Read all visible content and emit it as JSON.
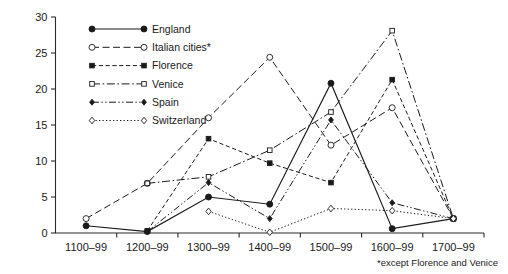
{
  "chart_data": {
    "type": "line",
    "title": "",
    "subtitle": "",
    "xlabel": "",
    "ylabel": "",
    "categories": [
      "1100–99",
      "1200–99",
      "1300–99",
      "1400–99",
      "1500–99",
      "1600–99",
      "1700–99"
    ],
    "ylim": [
      0,
      30
    ],
    "yticks": [
      0,
      5,
      10,
      15,
      20,
      25,
      30
    ],
    "ytick_labels": [
      "0",
      "5",
      "10",
      "15",
      "20",
      "25",
      "30"
    ],
    "grid": false,
    "legend_position": "upper-left-inside",
    "annotations": [
      "*except Florence and Venice"
    ],
    "footnote": "*except Florence and Venice",
    "series": [
      {
        "name": "England",
        "marker": "filled-circle",
        "dash": "solid",
        "values": [
          1.0,
          0.2,
          5.0,
          4.0,
          20.8,
          0.6,
          2.0
        ]
      },
      {
        "name": "Italian cities*",
        "marker": "open-circle",
        "dash": "long-dash",
        "values": [
          2.0,
          6.9,
          16.0,
          24.4,
          12.2,
          17.4,
          2.0
        ]
      },
      {
        "name": "Florence",
        "marker": "filled-square",
        "dash": "dashed",
        "values": [
          null,
          0.3,
          13.1,
          9.7,
          7.0,
          21.3,
          2.0
        ]
      },
      {
        "name": "Venice",
        "marker": "open-square",
        "dash": "dash-dot",
        "values": [
          null,
          6.9,
          7.8,
          11.5,
          16.8,
          28.1,
          2.0
        ]
      },
      {
        "name": "Spain",
        "marker": "filled-diamond",
        "dash": "dash-dot-dot",
        "values": [
          null,
          0.2,
          7.0,
          2.0,
          15.7,
          4.2,
          2.0
        ]
      },
      {
        "name": "Switzerland",
        "marker": "open-diamond",
        "dash": "dotted",
        "values": [
          null,
          null,
          3.0,
          0.1,
          3.4,
          3.1,
          2.0
        ]
      }
    ]
  },
  "legend": {
    "items": [
      {
        "label": "England"
      },
      {
        "label": "Italian cities*"
      },
      {
        "label": "Florence"
      },
      {
        "label": "Venice"
      },
      {
        "label": "Spain"
      },
      {
        "label": "Switzerland"
      }
    ]
  },
  "colors": {
    "ink": "#1a1a1a",
    "axis": "#2b2b2b",
    "background": "#ffffff",
    "marker_fill_open": "#ffffff"
  }
}
